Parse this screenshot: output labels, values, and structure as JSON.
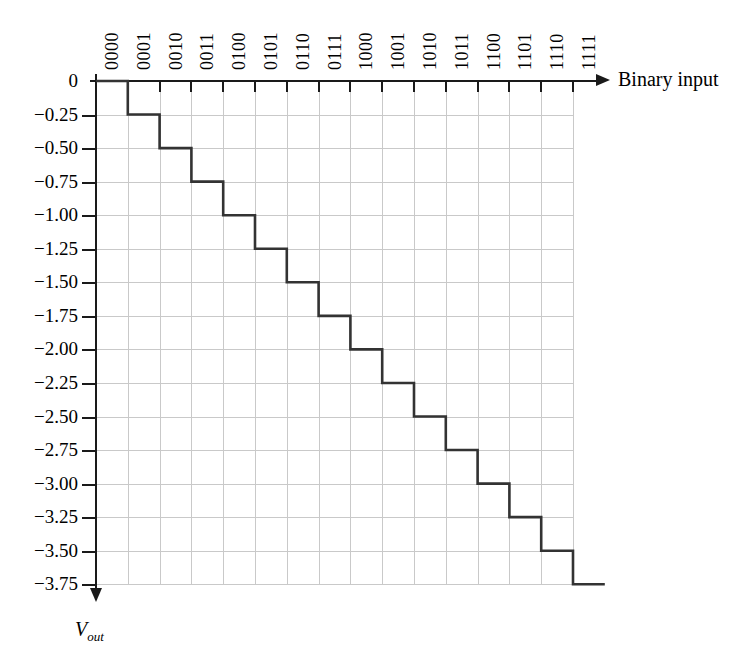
{
  "figure": {
    "background": "#ffffff",
    "line_color": "#333333",
    "grid_color": "#c9c9c9",
    "axis_color": "#1a1a1a"
  },
  "axes": {
    "x_title": "Binary input",
    "y_title_main": "V",
    "y_title_sub": "out",
    "x_arrow": "arrow-right",
    "y_arrow": "arrow-down"
  },
  "chart_data": {
    "type": "line",
    "title": "",
    "subtitle": "",
    "xlabel": "Binary input",
    "ylabel": "Vout",
    "grid": true,
    "legend": "none",
    "step": "post",
    "categories": [
      "0000",
      "0001",
      "0010",
      "0011",
      "0100",
      "0101",
      "0110",
      "0111",
      "1000",
      "1001",
      "1010",
      "1011",
      "1100",
      "1101",
      "1110",
      "1111"
    ],
    "values": [
      0.0,
      -0.25,
      -0.5,
      -0.75,
      -1.0,
      -1.25,
      -1.5,
      -1.75,
      -2.0,
      -2.25,
      -2.5,
      -2.75,
      -3.0,
      -3.25,
      -3.5,
      -3.75
    ],
    "ylim": [
      -3.9,
      0
    ],
    "ytick_labels": [
      "0",
      "−0.25",
      "−0.50",
      "−0.75",
      "−1.00",
      "−1.25",
      "−1.50",
      "−1.75",
      "−2.00",
      "−2.25",
      "−2.50",
      "−2.75",
      "−3.00",
      "−3.25",
      "−3.50",
      "−3.75"
    ],
    "ytick_values": [
      0.0,
      -0.25,
      -0.5,
      -0.75,
      -1.0,
      -1.25,
      -1.5,
      -1.75,
      -2.0,
      -2.25,
      -2.5,
      -2.75,
      -3.0,
      -3.25,
      -3.5,
      -3.75
    ],
    "xtick_labels": [
      "0000",
      "0001",
      "0010",
      "0011",
      "0100",
      "0101",
      "0110",
      "0111",
      "1000",
      "1001",
      "1010",
      "1011",
      "1100",
      "1101",
      "1110",
      "1111"
    ],
    "y_step_volts": -0.25,
    "annotations": []
  }
}
